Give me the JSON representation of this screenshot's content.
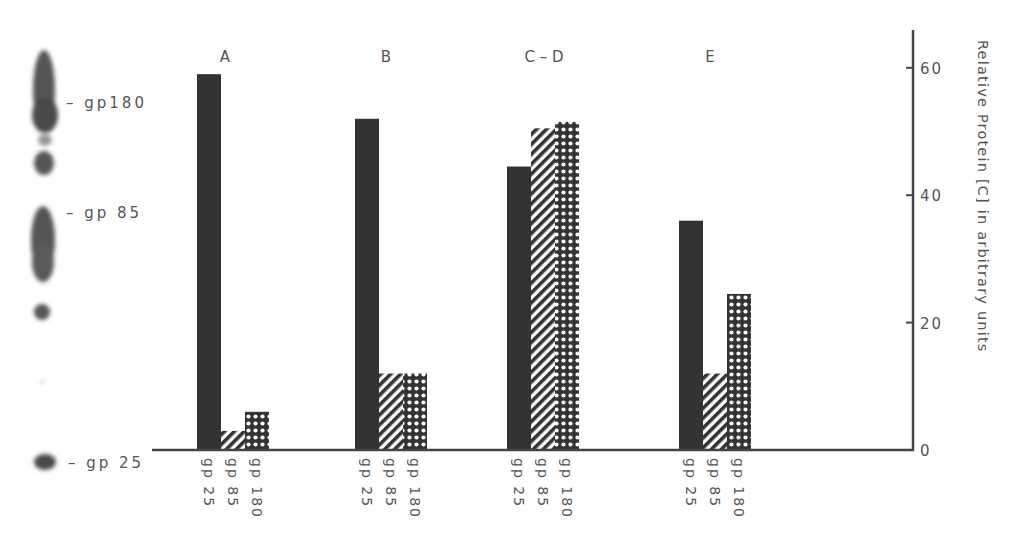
{
  "chart_data": {
    "type": "bar",
    "title": "",
    "group_labels": [
      "A",
      "B",
      "C – D",
      "E"
    ],
    "series": [
      {
        "name": "gp25",
        "pattern": "solid",
        "values": [
          59,
          52,
          44.5,
          36
        ]
      },
      {
        "name": "gp85",
        "pattern": "diagonal",
        "values": [
          3,
          12,
          50.5,
          12
        ]
      },
      {
        "name": "gp180",
        "pattern": "dots",
        "values": [
          6,
          12,
          51.5,
          24.5
        ]
      }
    ],
    "bar_tick_labels": [
      "gp25",
      "gp85",
      "gp180"
    ],
    "xlabel": "",
    "ylabel": "Relative Protein [C] in arbitrary units",
    "ylim": [
      0,
      65
    ],
    "yticks": [
      0,
      20,
      40,
      60
    ],
    "y_axis_position": "right",
    "grid": false,
    "legend": "none"
  },
  "gel": {
    "band_labels": [
      "– gp180",
      "– gp 85",
      "– gp 25"
    ]
  },
  "colors": {
    "bar_solid": "#333333",
    "axis": "#444444",
    "text": "#555555",
    "gel_band": "#555555"
  }
}
